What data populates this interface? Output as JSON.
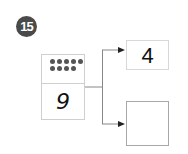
{
  "problem": {
    "number": "15",
    "card": {
      "dots_row1": 5,
      "dots_row2": 4,
      "value": "9"
    },
    "branches": [
      {
        "value": "4"
      },
      {
        "value": ""
      }
    ]
  }
}
